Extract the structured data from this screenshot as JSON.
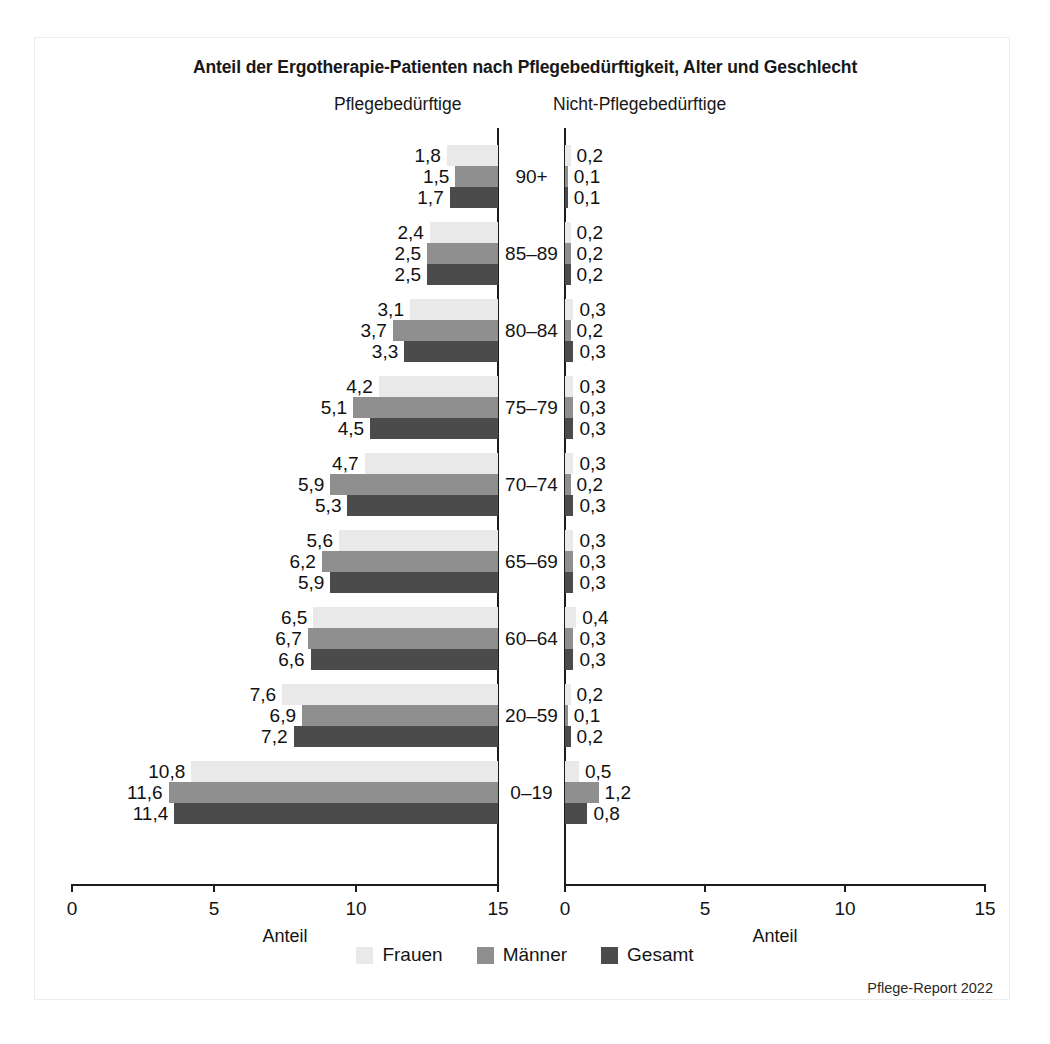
{
  "title": "Anteil der Ergotherapie-Patienten nach Pflegebedürftigkeit, Alter und Geschlecht",
  "panels": {
    "left_subtitle": "Pflegebedürftige",
    "right_subtitle": "Nicht-Pflegebedürftige"
  },
  "axis": {
    "caption": "Anteil",
    "left_ticks": [
      "15",
      "10",
      "5",
      "0"
    ],
    "right_ticks": [
      "0",
      "5",
      "10",
      "15"
    ]
  },
  "legend": [
    {
      "label": "Frauen",
      "color": "#e9e9e9"
    },
    {
      "label": "Männer",
      "color": "#8f8f8f"
    },
    {
      "label": "Gesamt",
      "color": "#4b4b4b"
    }
  ],
  "source": "Pflege-Report 2022",
  "colors": {
    "frauen": "#e9e9e9",
    "maenner": "#8f8f8f",
    "gesamt": "#4b4b4b",
    "axis": "#1c1c1c",
    "frame": "#ededed"
  },
  "chart_data": {
    "type": "bar",
    "orientation": "horizontal",
    "layout": "back-to-back population pyramid (two panels)",
    "title": "Anteil der Ergotherapie-Patienten nach Pflegebedürftigkeit, Alter und Geschlecht",
    "xlabel": "Anteil",
    "ylabel": "",
    "xlim": [
      0,
      15
    ],
    "grid": false,
    "legend_position": "bottom-center",
    "categories": [
      "90+",
      "85–89",
      "80–84",
      "75–79",
      "70–74",
      "65–69",
      "60–64",
      "20–59",
      "0–19"
    ],
    "panels": [
      {
        "name": "Pflegebedürftige",
        "direction": "left",
        "series": [
          {
            "name": "Frauen",
            "values": [
              1.8,
              2.4,
              3.1,
              4.2,
              4.7,
              5.6,
              6.5,
              7.6,
              10.8
            ],
            "labels": [
              "1,8",
              "2,4",
              "3,1",
              "4,2",
              "4,7",
              "5,6",
              "6,5",
              "7,6",
              "10,8"
            ]
          },
          {
            "name": "Männer",
            "values": [
              1.5,
              2.5,
              3.7,
              5.1,
              5.9,
              6.2,
              6.7,
              6.9,
              11.6
            ],
            "labels": [
              "1,5",
              "2,5",
              "3,7",
              "5,1",
              "5,9",
              "6,2",
              "6,7",
              "6,9",
              "11,6"
            ]
          },
          {
            "name": "Gesamt",
            "values": [
              1.7,
              2.5,
              3.3,
              4.5,
              5.3,
              5.9,
              6.6,
              7.2,
              11.4
            ],
            "labels": [
              "1,7",
              "2,5",
              "3,3",
              "4,5",
              "5,3",
              "5,9",
              "6,6",
              "7,2",
              "11,4"
            ]
          }
        ]
      },
      {
        "name": "Nicht-Pflegebedürftige",
        "direction": "right",
        "series": [
          {
            "name": "Frauen",
            "values": [
              0.2,
              0.2,
              0.3,
              0.3,
              0.3,
              0.3,
              0.4,
              0.2,
              0.5
            ],
            "labels": [
              "0,2",
              "0,2",
              "0,3",
              "0,3",
              "0,3",
              "0,3",
              "0,4",
              "0,2",
              "0,5"
            ]
          },
          {
            "name": "Männer",
            "values": [
              0.1,
              0.2,
              0.2,
              0.3,
              0.2,
              0.3,
              0.3,
              0.1,
              1.2
            ],
            "labels": [
              "0,1",
              "0,2",
              "0,2",
              "0,3",
              "0,2",
              "0,3",
              "0,3",
              "0,1",
              "1,2"
            ]
          },
          {
            "name": "Gesamt",
            "values": [
              0.1,
              0.2,
              0.3,
              0.3,
              0.3,
              0.3,
              0.3,
              0.2,
              0.8
            ],
            "labels": [
              "0,1",
              "0,2",
              "0,3",
              "0,3",
              "0,3",
              "0,3",
              "0,3",
              "0,2",
              "0,8"
            ]
          }
        ]
      }
    ]
  },
  "geometry": {
    "left_axis_x": 498,
    "left_zero_x": 498,
    "left_end_x": 72,
    "right_axis_x": 565,
    "right_end_x": 985,
    "axis_y": 884,
    "axis_top_y": 128,
    "row_top_y": 145,
    "row_pitch": 77,
    "bar_height": 21,
    "units_per_px_left": 0.0352,
    "units_per_px_right": 0.0357
  }
}
